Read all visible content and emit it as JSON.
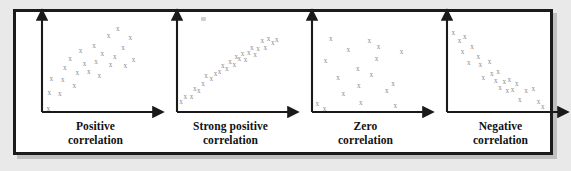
{
  "figure": {
    "marker_glyph": "x",
    "marker_color": "#8a8a8a",
    "axis_color": "#1a1a1a",
    "frame_color": "#1b1b1b",
    "page_background": "#e9e9e9",
    "panel_background": "#ffffff"
  },
  "chart_data": [
    {
      "type": "scatter",
      "title": "Positive correlation",
      "caption_lines": [
        "Positive",
        "correlation"
      ],
      "xlabel": "",
      "ylabel": "",
      "xlim": [
        0,
        100
      ],
      "ylim": [
        0,
        100
      ],
      "grid": false,
      "legend": "none",
      "axes": "arrow-axes, origin bottom-left, no tick labels",
      "points": [
        [
          6,
          4
        ],
        [
          7,
          22
        ],
        [
          9,
          38
        ],
        [
          17,
          21
        ],
        [
          20,
          37
        ],
        [
          22,
          51
        ],
        [
          27,
          62
        ],
        [
          31,
          30
        ],
        [
          34,
          45
        ],
        [
          37,
          71
        ],
        [
          41,
          56
        ],
        [
          45,
          47
        ],
        [
          50,
          77
        ],
        [
          52,
          58
        ],
        [
          55,
          42
        ],
        [
          58,
          67
        ],
        [
          64,
          88
        ],
        [
          66,
          55
        ],
        [
          70,
          64
        ],
        [
          73,
          96
        ],
        [
          78,
          74
        ],
        [
          80,
          53
        ],
        [
          85,
          86
        ],
        [
          88,
          60
        ]
      ]
    },
    {
      "type": "scatter",
      "title": "Strong positive correlation",
      "caption_lines": [
        "Strong positive",
        "correlation"
      ],
      "xlabel": "",
      "ylabel": "",
      "xlim": [
        0,
        100
      ],
      "ylim": [
        0,
        100
      ],
      "grid": false,
      "legend": "none",
      "axes": "arrow-axes, origin bottom-left, no tick labels",
      "points": [
        [
          4,
          12
        ],
        [
          8,
          17
        ],
        [
          14,
          17
        ],
        [
          17,
          27
        ],
        [
          21,
          25
        ],
        [
          25,
          33
        ],
        [
          28,
          42
        ],
        [
          33,
          38
        ],
        [
          37,
          44
        ],
        [
          41,
          46
        ],
        [
          44,
          53
        ],
        [
          48,
          50
        ],
        [
          51,
          58
        ],
        [
          55,
          55
        ],
        [
          57,
          64
        ],
        [
          60,
          62
        ],
        [
          63,
          68
        ],
        [
          66,
          60
        ],
        [
          69,
          69
        ],
        [
          72,
          75
        ],
        [
          75,
          66
        ],
        [
          78,
          73
        ],
        [
          82,
          82
        ],
        [
          85,
          75
        ],
        [
          88,
          85
        ],
        [
          92,
          80
        ],
        [
          96,
          84
        ]
      ]
    },
    {
      "type": "scatter",
      "title": "Zero correlation",
      "caption_lines": [
        "Zero",
        "correlation"
      ],
      "xlabel": "",
      "ylabel": "",
      "xlim": [
        0,
        100
      ],
      "ylim": [
        0,
        100
      ],
      "grid": false,
      "legend": "none",
      "axes": "arrow-axes, origin bottom-left, no tick labels",
      "points": [
        [
          5,
          9
        ],
        [
          12,
          4
        ],
        [
          13,
          59
        ],
        [
          18,
          85
        ],
        [
          25,
          39
        ],
        [
          30,
          21
        ],
        [
          35,
          72
        ],
        [
          44,
          50
        ],
        [
          45,
          30
        ],
        [
          47,
          11
        ],
        [
          55,
          82
        ],
        [
          57,
          43
        ],
        [
          62,
          62
        ],
        [
          64,
          76
        ],
        [
          72,
          25
        ],
        [
          78,
          33
        ],
        [
          80,
          7
        ],
        [
          86,
          70
        ]
      ]
    },
    {
      "type": "scatter",
      "title": "Negative correlation",
      "caption_lines": [
        "Negative",
        "correlation"
      ],
      "xlabel": "",
      "ylabel": "",
      "xlim": [
        0,
        100
      ],
      "ylim": [
        0,
        100
      ],
      "grid": false,
      "legend": "none",
      "axes": "arrow-axes, origin bottom-left, no tick labels",
      "points": [
        [
          6,
          92
        ],
        [
          12,
          82
        ],
        [
          17,
          87
        ],
        [
          15,
          70
        ],
        [
          24,
          76
        ],
        [
          21,
          57
        ],
        [
          30,
          64
        ],
        [
          32,
          55
        ],
        [
          35,
          40
        ],
        [
          41,
          58
        ],
        [
          43,
          44
        ],
        [
          47,
          36
        ],
        [
          49,
          46
        ],
        [
          51,
          28
        ],
        [
          55,
          35
        ],
        [
          58,
          24
        ],
        [
          60,
          37
        ],
        [
          63,
          26
        ],
        [
          67,
          32
        ],
        [
          70,
          14
        ],
        [
          76,
          25
        ],
        [
          83,
          27
        ],
        [
          88,
          12
        ],
        [
          92,
          6
        ]
      ]
    }
  ]
}
